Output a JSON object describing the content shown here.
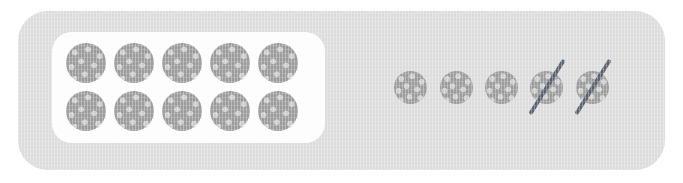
{
  "scene": {
    "title": "Ten-frame subtraction model",
    "background_color": "#ffffff",
    "panel_color": "#dcdcdc",
    "card_color": "#fdfdfd",
    "counter_color": "#9b9b9b",
    "counter_dot_color": "#cdcdcd",
    "crossout_color": "#58606a"
  },
  "ten_frame": {
    "label": "ten-frame",
    "rows": 2,
    "columns": 5,
    "filled_count": 10,
    "top_row": [
      {
        "index": 1,
        "x": 44,
        "y": 32
      },
      {
        "index": 2,
        "x": 92,
        "y": 32
      },
      {
        "index": 3,
        "x": 140,
        "y": 32
      },
      {
        "index": 4,
        "x": 188,
        "y": 32
      },
      {
        "index": 5,
        "x": 236,
        "y": 32
      }
    ],
    "bottom_row": [
      {
        "index": 6,
        "x": 44,
        "y": 76
      },
      {
        "index": 7,
        "x": 92,
        "y": 76
      },
      {
        "index": 8,
        "x": 140,
        "y": 76
      },
      {
        "index": 9,
        "x": 188,
        "y": 76
      },
      {
        "index": 10,
        "x": 236,
        "y": 76
      }
    ]
  },
  "loose_group": {
    "label": "loose counters group",
    "total_count": 5,
    "crossed_out_count": 2,
    "remaining_count": 3,
    "counters": [
      {
        "index": 1,
        "x": 394,
        "y": 71,
        "crossed_out": false
      },
      {
        "index": 2,
        "x": 440,
        "y": 71,
        "crossed_out": false
      },
      {
        "index": 3,
        "x": 485,
        "y": 71,
        "crossed_out": false
      },
      {
        "index": 4,
        "x": 530,
        "y": 71,
        "crossed_out": true
      },
      {
        "index": 5,
        "x": 576,
        "y": 71,
        "crossed_out": true
      }
    ]
  }
}
